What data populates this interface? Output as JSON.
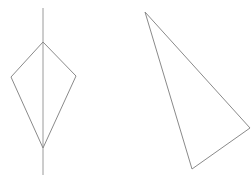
{
  "figure": {
    "background_color": "#ffffff",
    "stroke_color": "#8a8a8a",
    "axis_color": "#9a9a9a",
    "stroke_width": 1,
    "canvas": {
      "width": 251,
      "height": 182
    }
  },
  "chart_data": {
    "type": "scatter",
    "xlabel": "",
    "ylabel": "",
    "xlim": [
      0,
      251
    ],
    "ylim": [
      0,
      182
    ],
    "grid": false,
    "legend": "none",
    "shapes": [
      {
        "name": "kite-quadrilateral",
        "kind": "polygon",
        "closed": true,
        "vertex_count": 4,
        "points": [
          [
            43,
            42
          ],
          [
            11,
            77
          ],
          [
            43,
            148
          ],
          [
            76,
            76
          ]
        ],
        "points_label": "top, left, bottom, right",
        "stroke": "#8a8a8a",
        "fill": "none"
      },
      {
        "name": "scalene-triangle",
        "kind": "polygon",
        "closed": true,
        "vertex_count": 3,
        "points": [
          [
            145,
            12
          ],
          [
            250,
            128
          ],
          [
            192,
            169
          ]
        ],
        "points_label": "apex, right, bottom",
        "stroke": "#8a8a8a",
        "fill": "none"
      }
    ],
    "lines": [
      {
        "name": "vertical-axis-of-symmetry",
        "kind": "segment",
        "points": [
          [
            43,
            8
          ],
          [
            43,
            175
          ]
        ],
        "stroke": "#9a9a9a",
        "description": "vertical line through kite top and bottom vertices, extending past both"
      }
    ]
  }
}
